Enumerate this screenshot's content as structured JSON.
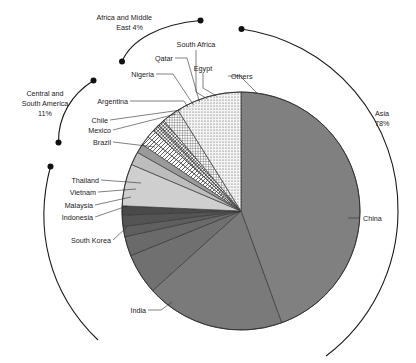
{
  "chart_data": {
    "type": "pie",
    "title": "",
    "subtitle": "",
    "xlabel": "",
    "ylabel": "",
    "legend_position": "callout-labels",
    "grid": false,
    "total_label": "100%",
    "categories": [
      "China",
      "India",
      "South Korea",
      "Indonesia",
      "Malaysia",
      "Vietnam",
      "Thailand",
      "Brazil",
      "Mexico",
      "Chile",
      "Argentina",
      "Nigeria",
      "Qatar",
      "South Africa",
      "Egypt",
      "Others"
    ],
    "values": [
      44.0,
      19.0,
      6.0,
      3.0,
      1.4,
      1.6,
      2.0,
      6.0,
      1.8,
      1.2,
      1.2,
      1.1,
      1.0,
      0.9,
      1.0,
      8.8
    ],
    "groups": [
      {
        "name": "Asia",
        "percent_label": "Asia\n78%",
        "label_line1": "Asia",
        "label_line2": "78%",
        "value": 78
      },
      {
        "name": "Central and South America",
        "label_line1": "Central and",
        "label_line2": "South America",
        "label_line3": "11%",
        "value": 11
      },
      {
        "name": "Africa and Middle East",
        "label_line1": "Africa and Middle",
        "label_line2": "East 4%",
        "value": 4
      },
      {
        "name": "Others",
        "label_line1": "Others",
        "value": 7
      }
    ],
    "slices": [
      {
        "label": "China",
        "fill": "#808080",
        "pattern": "solid",
        "start_deg": 0,
        "end_deg": 160.0
      },
      {
        "label": "India",
        "fill": "#7a7a7a",
        "pattern": "solid",
        "start_deg": 160.0,
        "end_deg": 228.0
      },
      {
        "label": "South Korea",
        "fill": "#707070",
        "pattern": "solid",
        "start_deg": 228.0,
        "end_deg": 248.0
      },
      {
        "label": "Indonesia",
        "fill": "#6a6a6a",
        "pattern": "solid",
        "start_deg": 248.0,
        "end_deg": 257.5
      },
      {
        "label": "Malaysia",
        "fill": "#5f5f5f",
        "pattern": "solid",
        "start_deg": 257.5,
        "end_deg": 262.5
      },
      {
        "label": "Vietnam",
        "fill": "#545454",
        "pattern": "solid",
        "start_deg": 262.5,
        "end_deg": 268.0
      },
      {
        "label": "Thailand",
        "fill": "#4a4a4a",
        "pattern": "solid",
        "start_deg": 268.0,
        "end_deg": 272.5
      },
      {
        "label": "Brazil",
        "fill": "#cfcfcf",
        "pattern": "solid",
        "start_deg": 272.5,
        "end_deg": 293.0
      },
      {
        "label": "Mexico",
        "fill": "#bdbdbd",
        "pattern": "solid",
        "start_deg": 293.0,
        "end_deg": 299.5
      },
      {
        "label": "Chile",
        "fill": "#9a9a9a",
        "pattern": "solid",
        "start_deg": 299.5,
        "end_deg": 304.0
      },
      {
        "label": "Argentina",
        "fill": "#ffffff",
        "pattern": "diag-hatch",
        "start_deg": 304.0,
        "end_deg": 308.5
      },
      {
        "label": "Nigeria",
        "fill": "#ffffff",
        "pattern": "diag-hatch",
        "start_deg": 308.5,
        "end_deg": 312.5
      },
      {
        "label": "Qatar",
        "fill": "#ffffff",
        "pattern": "cross-hatch",
        "start_deg": 312.5,
        "end_deg": 316.0
      },
      {
        "label": "South Africa",
        "fill": "#ffffff",
        "pattern": "cross-hatch",
        "start_deg": 316.0,
        "end_deg": 319.5
      },
      {
        "label": "Egypt",
        "fill": "#ffffff",
        "pattern": "grid-fine",
        "start_deg": 319.5,
        "end_deg": 328.0
      },
      {
        "label": "Others",
        "fill": "#f2f2f2",
        "pattern": "dots",
        "start_deg": 328.0,
        "end_deg": 360.0
      }
    ],
    "colors": {
      "primary_gray": "#808080",
      "light_gray": "#cfcfcf",
      "outline": "#1a1a1a",
      "text": "#1b1b1b",
      "background": "#ffffff"
    }
  },
  "labels": {
    "africa_line1": "Africa and Middle",
    "africa_line2": "East 4%",
    "south_africa": "South Africa",
    "qatar": "Qatar",
    "egypt": "Egypt",
    "nigeria": "Nigeria",
    "others": "Others",
    "csa_line1": "Central and",
    "csa_line2": "South America",
    "csa_line3": "11%",
    "argentina": "Argentina",
    "chile": "Chile",
    "mexico": "Mexico",
    "brazil": "Brazil",
    "thailand": "Thailand",
    "vietnam": "Vietnam",
    "malaysia": "Malaysia",
    "indonesia": "Indonesia",
    "south_korea": "South Korea",
    "india": "India",
    "china": "China",
    "asia_line1": "Asia",
    "asia_line2": "78%"
  }
}
